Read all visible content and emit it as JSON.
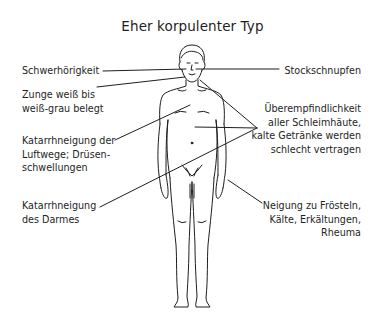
{
  "title": "Eher korpulenter Typ",
  "labels": {
    "schwerhoerigkeit": {
      "lines": [
        "Schwerhörigkeit"
      ]
    },
    "zunge": {
      "lines": [
        "Zunge weiß bis",
        "weiß-grau belegt"
      ]
    },
    "luftwege": {
      "lines": [
        "Katarrhneigung der",
        "Luftwege; Drüsen-",
        "schwellungen"
      ]
    },
    "darm": {
      "lines": [
        "Katarrhneigung",
        "des Darmes"
      ]
    },
    "stockschnupfen": {
      "lines": [
        "Stockschnupfen"
      ]
    },
    "schleimhaeute": {
      "lines": [
        "Überempfindlichkeit",
        "aller Schleimhäute,",
        "kalte Getränke werden",
        "schlecht vertragen"
      ]
    },
    "froesteln": {
      "lines": [
        "Neigung zu Frösteln,",
        "Kälte, Erkältungen,",
        "Rheuma"
      ]
    }
  },
  "colors": {
    "ink": "#1e1e1e",
    "background": "#ffffff"
  }
}
